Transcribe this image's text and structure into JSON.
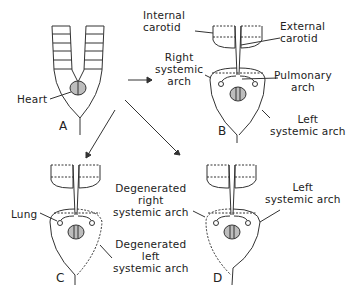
{
  "diagram": {
    "panels": [
      "A",
      "B",
      "C",
      "D"
    ],
    "labels": {
      "heart": "Heart",
      "internal_carotid": [
        "Internal",
        "carotid"
      ],
      "external_carotid": [
        "External",
        "carotid"
      ],
      "right_systemic_arch": [
        "Right",
        "systemic",
        "arch"
      ],
      "pulmonary_arch": [
        "Pulmonary",
        "arch"
      ],
      "left_systemic_arch_b": [
        "Left",
        "systemic arch"
      ],
      "lung": "Lung",
      "degenerated_right": [
        "Degenerated",
        "right",
        "systemic arch"
      ],
      "degenerated_left": [
        "Degenerated",
        "left",
        "systemic arch"
      ],
      "left_systemic_arch_d": [
        "Left",
        "systemic arch"
      ]
    },
    "colors": {
      "stroke": "#333333",
      "heart_fill": "#bdbdbd"
    }
  }
}
